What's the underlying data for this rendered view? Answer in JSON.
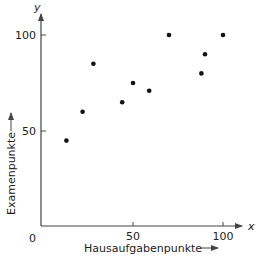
{
  "chart_data": {
    "type": "scatter",
    "title": "",
    "xlabel": "Hausaufgabenpunkte",
    "ylabel": "Examenpunkte",
    "x_var": "x",
    "y_var": "y",
    "origin_label": "0",
    "xlim": [
      0,
      110
    ],
    "ylim": [
      0,
      110
    ],
    "xticks": [
      50,
      100
    ],
    "yticks": [
      50,
      100
    ],
    "grid": false,
    "legend": null,
    "points": [
      {
        "x": 13,
        "y": 45
      },
      {
        "x": 22,
        "y": 60
      },
      {
        "x": 28,
        "y": 85
      },
      {
        "x": 44,
        "y": 65
      },
      {
        "x": 50,
        "y": 75
      },
      {
        "x": 59,
        "y": 71
      },
      {
        "x": 70,
        "y": 100
      },
      {
        "x": 88,
        "y": 80
      },
      {
        "x": 90,
        "y": 90
      },
      {
        "x": 100,
        "y": 100
      }
    ]
  },
  "colors": {
    "axis": "#444444",
    "point": "#111111",
    "text": "#222222"
  }
}
